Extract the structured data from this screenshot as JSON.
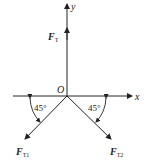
{
  "diagram": {
    "axes": {
      "x_label": "x",
      "y_label": "y",
      "origin_label": "O"
    },
    "forces": [
      {
        "name": "F",
        "subscript": "T",
        "direction": "up"
      },
      {
        "name": "F",
        "subscript": "T1",
        "direction": "down-left",
        "angle_label": "45°"
      },
      {
        "name": "F",
        "subscript": "T2",
        "direction": "down-right",
        "angle_label": "45°"
      }
    ],
    "colors": {
      "line": "#222222",
      "background": "#ffffff"
    }
  }
}
